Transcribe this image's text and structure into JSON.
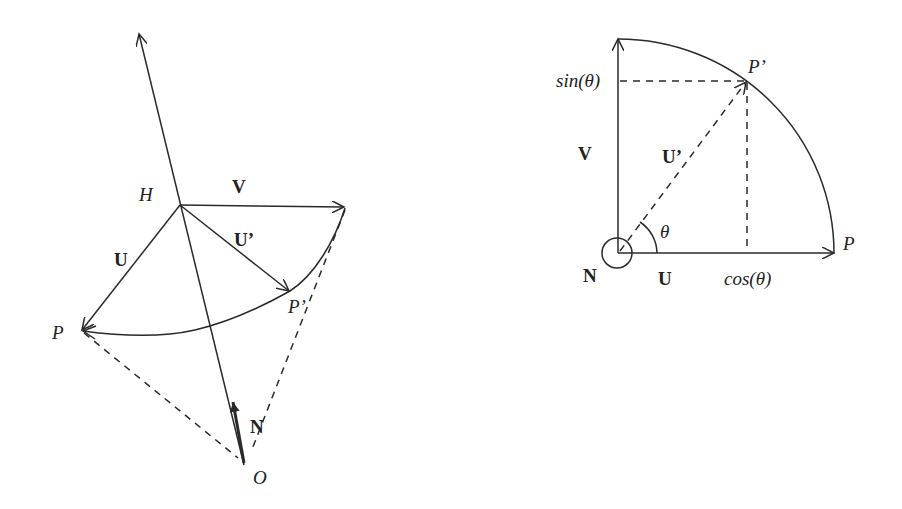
{
  "left_diagram": {
    "labels": {
      "H": "H",
      "V": "V",
      "U": "U",
      "U_prime": "U’",
      "P": "P",
      "P_prime": "P’",
      "N": "N",
      "O": "O"
    }
  },
  "right_diagram": {
    "labels": {
      "sin": "sin(θ)",
      "P_prime": "P’",
      "V": "V",
      "U_prime": "U’",
      "theta": "θ",
      "P": "P",
      "N": "N",
      "U": "U",
      "cos": "cos(θ)"
    }
  },
  "colors": {
    "ink": "#2a2a2a",
    "background": "#ffffff"
  }
}
